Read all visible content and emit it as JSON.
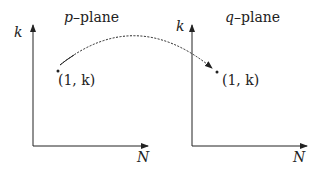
{
  "panels": [
    {
      "name": "p-plane",
      "title_var": "p",
      "title_rest": "–plane",
      "y_axis": "k",
      "x_axis": "N",
      "point": "(1, k)"
    },
    {
      "name": "q-plane",
      "title_var": "q",
      "title_rest": "–plane",
      "y_axis": "k",
      "x_axis": "N",
      "point": "(1, k)"
    }
  ],
  "arrow": {
    "style": "dotted arc",
    "from": "p-plane point",
    "to": "q-plane point"
  }
}
